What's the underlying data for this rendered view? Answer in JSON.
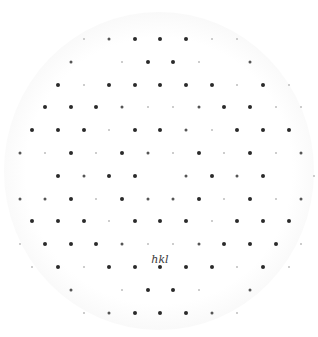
{
  "figure": {
    "label": "hkl",
    "label_pos": {
      "x": 160,
      "y": 259
    },
    "colors": {
      "background": "#ffffff",
      "spot_strong": "#2a2a2a",
      "spot_medium": "#555555",
      "spot_faint": "#bdbdbd",
      "label": "#3a3a3a"
    },
    "rows": [
      {
        "y": 39,
        "spots": [
          [
            84,
            "faint"
          ],
          [
            109,
            "medium"
          ],
          [
            135,
            "strong"
          ],
          [
            160,
            "strong"
          ],
          [
            186,
            "strong"
          ],
          [
            212,
            "faint"
          ],
          [
            237,
            "faint"
          ]
        ]
      },
      {
        "y": 62,
        "spots": [
          [
            71,
            "medium"
          ],
          [
            122,
            "faint"
          ],
          [
            148,
            "strong"
          ],
          [
            173,
            "strong"
          ],
          [
            199,
            "faint"
          ],
          [
            250,
            "medium"
          ]
        ]
      },
      {
        "y": 85,
        "spots": [
          [
            58,
            "strong"
          ],
          [
            84,
            "faint"
          ],
          [
            109,
            "strong"
          ],
          [
            135,
            "strong"
          ],
          [
            160,
            "strong"
          ],
          [
            186,
            "strong"
          ],
          [
            212,
            "strong"
          ],
          [
            237,
            "faint"
          ],
          [
            263,
            "strong"
          ],
          [
            289,
            "faint"
          ]
        ]
      },
      {
        "y": 107,
        "spots": [
          [
            45,
            "strong"
          ],
          [
            71,
            "strong"
          ],
          [
            96,
            "strong"
          ],
          [
            122,
            "medium"
          ],
          [
            148,
            "faint"
          ],
          [
            173,
            "faint"
          ],
          [
            199,
            "medium"
          ],
          [
            224,
            "strong"
          ],
          [
            250,
            "strong"
          ],
          [
            276,
            "faint"
          ],
          [
            301,
            "faint"
          ]
        ]
      },
      {
        "y": 130,
        "spots": [
          [
            32,
            "strong"
          ],
          [
            58,
            "strong"
          ],
          [
            84,
            "strong"
          ],
          [
            109,
            "faint"
          ],
          [
            135,
            "strong"
          ],
          [
            160,
            "strong"
          ],
          [
            186,
            "medium"
          ],
          [
            212,
            "faint"
          ],
          [
            237,
            "strong"
          ],
          [
            263,
            "strong"
          ],
          [
            289,
            "strong"
          ]
        ]
      },
      {
        "y": 153,
        "spots": [
          [
            20,
            "medium"
          ],
          [
            45,
            "faint"
          ],
          [
            71,
            "strong"
          ],
          [
            96,
            "faint"
          ],
          [
            122,
            "strong"
          ],
          [
            148,
            "medium"
          ],
          [
            173,
            "faint"
          ],
          [
            199,
            "strong"
          ],
          [
            224,
            "faint"
          ],
          [
            250,
            "strong"
          ],
          [
            276,
            "faint"
          ],
          [
            301,
            "medium"
          ]
        ]
      },
      {
        "y": 176,
        "spots": [
          [
            58,
            "strong"
          ],
          [
            84,
            "medium"
          ],
          [
            109,
            "strong"
          ],
          [
            135,
            "strong"
          ],
          [
            186,
            "medium"
          ],
          [
            212,
            "strong"
          ],
          [
            237,
            "medium"
          ],
          [
            263,
            "strong"
          ],
          [
            314,
            "faint"
          ]
        ]
      },
      {
        "y": 199,
        "spots": [
          [
            20,
            "medium"
          ],
          [
            45,
            "medium"
          ],
          [
            71,
            "strong"
          ],
          [
            96,
            "faint"
          ],
          [
            122,
            "strong"
          ],
          [
            148,
            "medium"
          ],
          [
            173,
            "medium"
          ],
          [
            199,
            "strong"
          ],
          [
            224,
            "faint"
          ],
          [
            250,
            "strong"
          ],
          [
            276,
            "faint"
          ],
          [
            301,
            "medium"
          ]
        ]
      },
      {
        "y": 221,
        "spots": [
          [
            32,
            "strong"
          ],
          [
            58,
            "strong"
          ],
          [
            84,
            "strong"
          ],
          [
            109,
            "faint"
          ],
          [
            135,
            "strong"
          ],
          [
            160,
            "strong"
          ],
          [
            186,
            "strong"
          ],
          [
            212,
            "faint"
          ],
          [
            237,
            "strong"
          ],
          [
            263,
            "strong"
          ],
          [
            289,
            "strong"
          ]
        ]
      },
      {
        "y": 244,
        "spots": [
          [
            20,
            "faint"
          ],
          [
            45,
            "strong"
          ],
          [
            71,
            "strong"
          ],
          [
            96,
            "strong"
          ],
          [
            122,
            "medium"
          ],
          [
            148,
            "faint"
          ],
          [
            173,
            "faint"
          ],
          [
            199,
            "medium"
          ],
          [
            224,
            "strong"
          ],
          [
            250,
            "strong"
          ],
          [
            276,
            "strong"
          ],
          [
            301,
            "faint"
          ]
        ]
      },
      {
        "y": 267,
        "spots": [
          [
            32,
            "faint"
          ],
          [
            58,
            "strong"
          ],
          [
            84,
            "faint"
          ],
          [
            109,
            "strong"
          ],
          [
            135,
            "strong"
          ],
          [
            160,
            "strong"
          ],
          [
            186,
            "strong"
          ],
          [
            212,
            "strong"
          ],
          [
            237,
            "faint"
          ],
          [
            263,
            "strong"
          ],
          [
            289,
            "faint"
          ]
        ]
      },
      {
        "y": 290,
        "spots": [
          [
            71,
            "medium"
          ],
          [
            122,
            "faint"
          ],
          [
            148,
            "strong"
          ],
          [
            173,
            "strong"
          ],
          [
            199,
            "faint"
          ],
          [
            250,
            "medium"
          ]
        ]
      },
      {
        "y": 313,
        "spots": [
          [
            84,
            "faint"
          ],
          [
            109,
            "medium"
          ],
          [
            135,
            "strong"
          ],
          [
            160,
            "strong"
          ],
          [
            186,
            "strong"
          ],
          [
            212,
            "medium"
          ],
          [
            237,
            "faint"
          ]
        ]
      }
    ]
  }
}
